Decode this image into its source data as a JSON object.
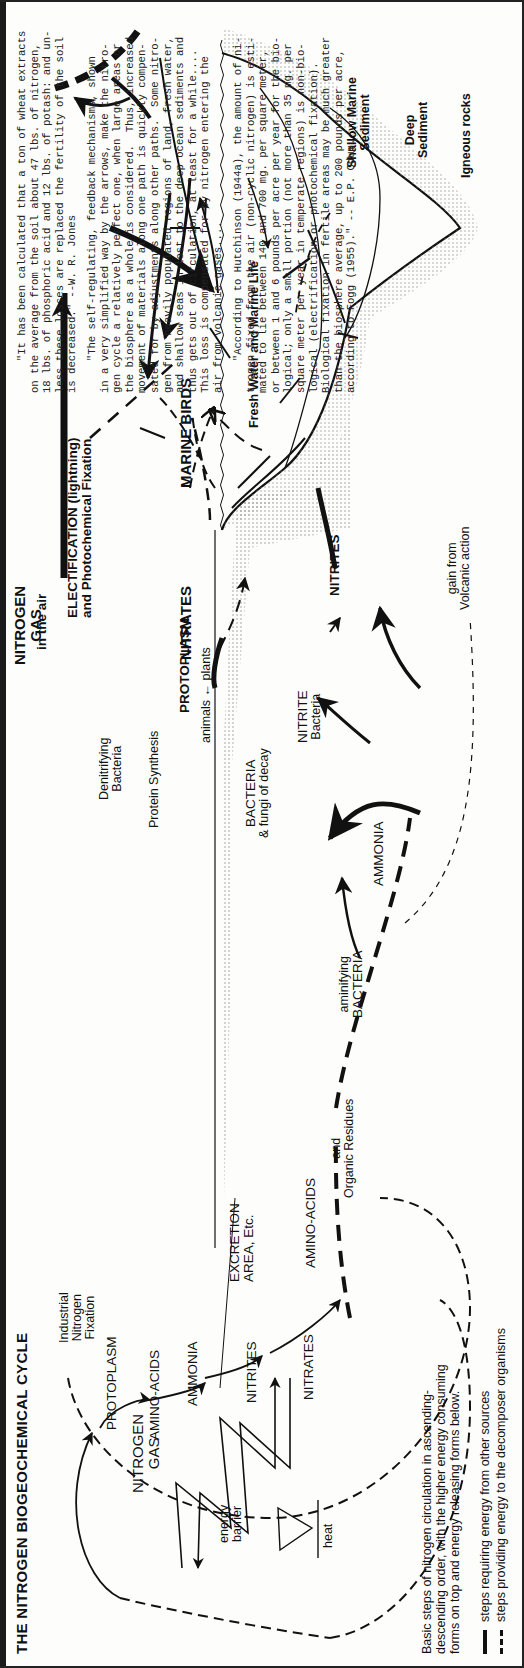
{
  "title": "THE NITROGEN BIOGEOCHEMICAL CYCLE",
  "energy_cycle": {
    "nitrogen_gas": [
      "NITROGEN",
      "GAS"
    ],
    "steps": [
      "PROTOPLASM",
      "AMINO-ACIDS",
      "AMMONIA",
      "NITRITES",
      "NITRATES"
    ],
    "energy_barrier": [
      "energy",
      "barrier"
    ],
    "heat": "heat"
  },
  "caption": "Basic steps of nitrogen circulation in ascending-\ndescending order, with the higher energy consuming\nforms on top and energy releasing forms below.",
  "legend": [
    {
      "style": "solid",
      "label": "steps requiring energy from other sources"
    },
    {
      "style": "dashed",
      "label": "steps providing energy to the decomposer organisms"
    }
  ],
  "atmosphere": {
    "industrial_fixation": [
      "Industrial",
      "Nitrogen",
      "Fixation"
    ],
    "nitrogen_gas": [
      "NITROGEN",
      "GAS"
    ],
    "in_the_air": "in the air",
    "denitrifying": [
      "Denitrifying",
      "Bacteria"
    ],
    "electrification": [
      "ELECTIFICATION (lightning)",
      "and Photochemical Fixation"
    ],
    "nitrates": "NITRATES",
    "marine_birds": "MARINE BIRDS"
  },
  "land": {
    "protein_synthesis": "Protein Synthesis",
    "protoplasm": "PROTOPLASM",
    "animals_plants": "animals ← plants",
    "excretion": [
      "EXCRETION",
      "AREA, Etc."
    ],
    "bacteria_decay": [
      "BACTERIA",
      "& fungi of decay"
    ],
    "amino_acids": "AMINO-ACIDS",
    "organic_residues": [
      "and",
      "Organic Residues"
    ],
    "aminifying": [
      "aminifying",
      "BACTERIA"
    ],
    "ammonia": "AMMONIA",
    "nitrite_bacteria": [
      "NITRITE",
      "Bacteria"
    ],
    "nitrites": "NITRITES",
    "volcanic": [
      "gain from",
      "Volcanic action"
    ]
  },
  "ocean": {
    "fresh_water": "Fresh Water and Marine Life",
    "shallow": [
      "Shallow Marine",
      "Sediment"
    ],
    "deep": [
      "Deep",
      "Sediment"
    ],
    "igneous": "Igneous rocks"
  },
  "quotes": [
    {
      "text": "     \"It has been calculated that a ton of wheat extracts\non the average from the soil about 47 lbs. of nitrogen,\n18 lbs. of phosphoric acid and 12 lbs. of potash: and un-\nless these losses are replaced the fertility of the soil\nis decreased.\" --W. R. Jones"
    },
    {
      "text": "     \"The self-regulating, feedback mechanisms, shown\nin a very simplified way by the arrows, make the nitro-\ngen cycle a relatively perfect one, when large areas or\nthe biosphere as a whole is considered.  Thus, increased\nmovement of materials along one path is quickly compen-\nsated for by adjustments along other paths.  Some nitro-\ngen from heavily populated regions of land, fresh water,\nand shallow seas in lost to the deep ocean sediments and\nthus gets out of circulation, at least for a while....\nThis loss is compensated for by nitrogen entering the\nair from volcanic gases...."
    },
    {
      "text": "     \"According to Hutchinson (1944a), the amount of ni-\ntrogen fixed from the air (non-cyclic nitrogen) is esti-\nmated to lie between 140 and 700 mg. per square meter,\nor between 1 and 6 pounds per acre per year for the bio-\nlogical; only a small portion (not more than 35 mg. per\nsquare meter per year in temperate regions) is non-bio-\nlogical (electrification or photochemical fixation).\nBiological fixation in fertile areas may be much greater\nthan the biosphere average, up to 200 pounds per acre,\naccording to Fogg (1955).\" -- E.P. Odum."
    }
  ],
  "colors": {
    "ink": "#111111",
    "paper": "#fdfdfc",
    "stipple": "#9a9a9a"
  }
}
